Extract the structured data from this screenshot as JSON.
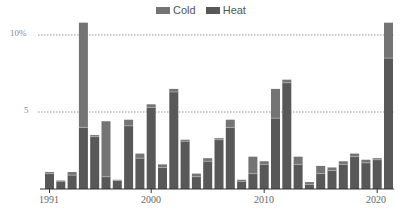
{
  "chart_data": {
    "type": "bar",
    "stacked": true,
    "title": "",
    "xlabel": "",
    "ylabel": "",
    "ylim": [
      0,
      11
    ],
    "y_ticks": [
      {
        "value": 5,
        "label": "5"
      },
      {
        "value": 10,
        "label": "10%"
      }
    ],
    "x_tick_labels": [
      "1991",
      "2000",
      "2010",
      "2020"
    ],
    "grid": "dotted horizontal at 5 and 10",
    "legend_position": "top-center",
    "categories": [
      "1991",
      "1992",
      "1993",
      "1994",
      "1995",
      "1996",
      "1997",
      "1998",
      "1999",
      "2000",
      "2001",
      "2002",
      "2003",
      "2004",
      "2005",
      "2006",
      "2007",
      "2008",
      "2009",
      "2010",
      "2011",
      "2012",
      "2013",
      "2014",
      "2015",
      "2016",
      "2017",
      "2018",
      "2019",
      "2020",
      "2021"
    ],
    "series": [
      {
        "name": "Heat",
        "color": "#585858",
        "values": [
          1.0,
          0.5,
          0.9,
          4.0,
          3.4,
          0.8,
          0.55,
          4.1,
          2.0,
          5.3,
          1.4,
          6.3,
          3.1,
          0.8,
          1.8,
          3.2,
          4.0,
          0.5,
          1.0,
          1.6,
          4.6,
          6.9,
          1.6,
          0.3,
          1.0,
          1.2,
          1.6,
          2.1,
          1.7,
          1.9,
          8.5
        ]
      },
      {
        "name": "Cold",
        "color": "#747474",
        "values": [
          0.1,
          0.05,
          0.2,
          6.8,
          0.1,
          3.6,
          0.05,
          0.4,
          0.3,
          0.2,
          0.2,
          0.2,
          0.1,
          0.2,
          0.2,
          0.1,
          0.5,
          0.1,
          1.1,
          0.2,
          1.9,
          0.2,
          0.5,
          0.15,
          0.5,
          0.2,
          0.2,
          0.2,
          0.2,
          0.1,
          2.3
        ]
      }
    ]
  },
  "legend": {
    "items": [
      {
        "label": "Cold",
        "color": "#747474"
      },
      {
        "label": "Heat",
        "color": "#585858"
      }
    ]
  },
  "axes": {
    "y_labels": [
      "10%",
      "5"
    ],
    "x_labels": [
      "1991",
      "2000",
      "2010",
      "2020"
    ]
  }
}
